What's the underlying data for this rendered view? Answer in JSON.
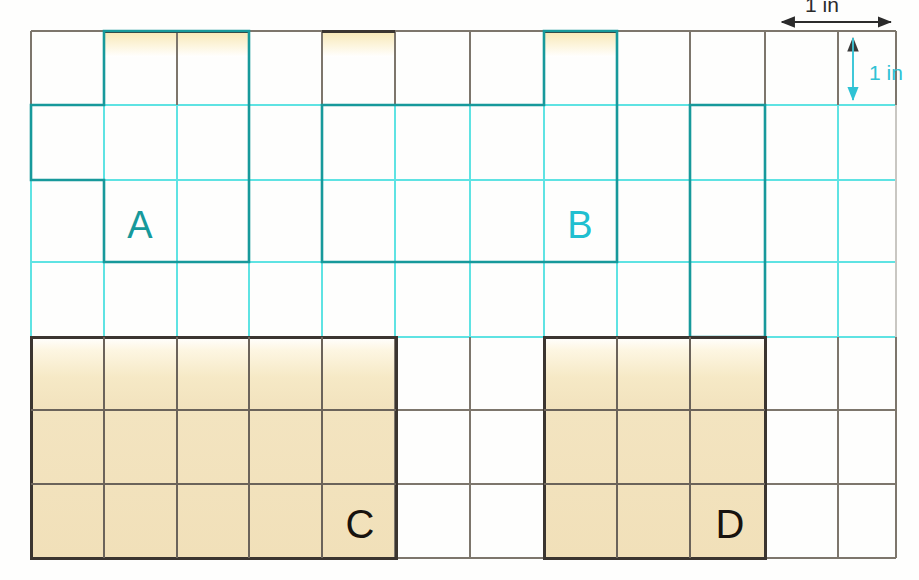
{
  "page": {
    "background_color": "#fdfdfb",
    "width": 919,
    "height": 580
  },
  "grid": {
    "columns": 11,
    "rows": 7,
    "cell_width_px": 73,
    "cell_height_px": 75,
    "origin_x_px": 31,
    "origin_y_px": 30,
    "unit_label": "1 in",
    "grid_line_color_upper": "#5fe6e6",
    "grid_line_color_lower": "#6b6257",
    "border_color": "#4a4views"
  },
  "colors": {
    "cyan_line": "#4fdede",
    "cyan_shape": "#1ba0a0",
    "cyan_text": "#16b9c9",
    "dark_line": "#5a524a",
    "dark_shape": "#3b3530",
    "fill_tan": "#f2e2bd",
    "fill_tan_light": "#fbf3dd",
    "white": "#ffffff"
  },
  "legend": {
    "horizontal": {
      "label": "1 in",
      "color": "#2b2b2b",
      "arrow": "double-headed-horizontal",
      "position": "top-right"
    },
    "vertical": {
      "label": "1 in",
      "color": "#2fc2d4",
      "arrow": "double-headed-vertical",
      "position": "right"
    }
  },
  "shapes": [
    {
      "id": "A",
      "label": "A",
      "label_color": "#1ba0a0",
      "outline_color": "#1ba0a0",
      "fill": "none",
      "area_sq_in": 7,
      "perimeter_in": 12,
      "cells": [
        {
          "col": 1,
          "row": 0
        },
        {
          "col": 2,
          "row": 0
        },
        {
          "col": 0,
          "row": 1
        },
        {
          "col": 1,
          "row": 1
        },
        {
          "col": 2,
          "row": 1
        },
        {
          "col": 1,
          "row": 2
        },
        {
          "col": 2,
          "row": 2
        }
      ],
      "label_cell": {
        "col": 1,
        "row": 2
      }
    },
    {
      "id": "B",
      "label": "B",
      "label_color": "#16b9c9",
      "outline_color": "#1ba0a0",
      "fill": "none",
      "area_sq_in": 11,
      "perimeter_in": 20,
      "cells": [
        {
          "col": 7,
          "row": 0
        },
        {
          "col": 4,
          "row": 1
        },
        {
          "col": 5,
          "row": 1
        },
        {
          "col": 6,
          "row": 1
        },
        {
          "col": 7,
          "row": 1
        },
        {
          "col": 9,
          "row": 1
        },
        {
          "col": 4,
          "row": 2
        },
        {
          "col": 5,
          "row": 2
        },
        {
          "col": 6,
          "row": 2
        },
        {
          "col": 7,
          "row": 2
        },
        {
          "col": 9,
          "row": 2
        },
        {
          "col": 9,
          "row": 3
        }
      ],
      "label_cell": {
        "col": 7,
        "row": 2
      }
    },
    {
      "id": "C",
      "label": "C",
      "label_color": "#1a1a1a",
      "outline_color": "#3b3530",
      "fill": "#f2e2bd",
      "area_sq_in": 15,
      "perimeter_in": 16,
      "rect": {
        "col": 0,
        "row": 4,
        "width": 5,
        "height": 3
      },
      "label_cell": {
        "col": 4,
        "row": 6
      }
    },
    {
      "id": "D",
      "label": "D",
      "label_color": "#1a1a1a",
      "outline_color": "#3b3530",
      "fill": "#f2e2bd",
      "area_sq_in": 9,
      "perimeter_in": 12,
      "rect": {
        "col": 7,
        "row": 4,
        "width": 3,
        "height": 3
      },
      "label_cell": {
        "col": 9,
        "row": 6
      }
    }
  ]
}
